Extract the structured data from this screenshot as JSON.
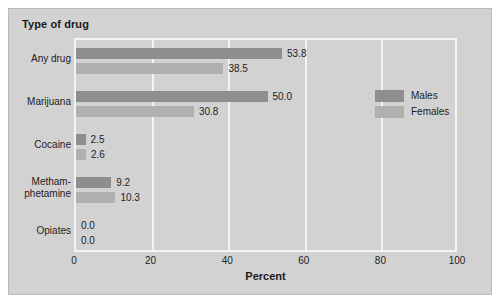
{
  "figure": {
    "title": "Type of drug",
    "background_color": "#d2d2d2",
    "border_color": "#b9b9b9",
    "gridline_color": "#f4f4f4"
  },
  "legend": {
    "position": "inside-right",
    "entries": [
      {
        "label": "Males",
        "color": "#8e8e8e"
      },
      {
        "label": "Females",
        "color": "#b0b0b0"
      }
    ]
  },
  "axis": {
    "x_label": "Percent",
    "x_ticks": [
      "0",
      "20",
      "40",
      "60",
      "80",
      "100"
    ]
  },
  "chart_data": {
    "type": "bar",
    "orientation": "horizontal",
    "title": "Type of drug",
    "xlabel": "Percent",
    "ylabel": "",
    "xlim": [
      0,
      100
    ],
    "xticks": [
      0,
      20,
      40,
      60,
      80,
      100
    ],
    "grid": true,
    "legend_position": "inside-right",
    "categories": [
      "Any drug",
      "Marijuana",
      "Cocaine",
      "Metham-phetamine",
      "Opiates"
    ],
    "category_labels": [
      [
        "Any drug"
      ],
      [
        "Marijuana"
      ],
      [
        "Cocaine"
      ],
      [
        "Metham-",
        "phetamine"
      ],
      [
        "Opiates"
      ]
    ],
    "series": [
      {
        "name": "Males",
        "color": "#8e8e8e",
        "values": [
          53.8,
          50.0,
          2.5,
          9.2,
          0.0
        ],
        "labels": [
          "53.8",
          "50.0",
          "2.5",
          "9.2",
          "0.0"
        ]
      },
      {
        "name": "Females",
        "color": "#b0b0b0",
        "values": [
          38.5,
          30.8,
          2.6,
          10.3,
          0.0
        ],
        "labels": [
          "38.5",
          "30.8",
          "2.6",
          "10.3",
          "0.0"
        ]
      }
    ]
  }
}
